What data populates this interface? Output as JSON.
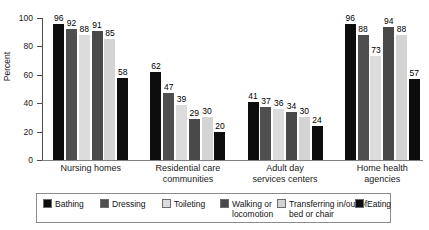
{
  "chart_data": {
    "type": "bar",
    "title": "",
    "xlabel": "",
    "ylabel": "Percent",
    "ylim": [
      0,
      100
    ],
    "yticks": [
      0,
      20,
      40,
      60,
      80,
      100
    ],
    "ytick_labels": [
      "0",
      "20",
      "40",
      "60",
      "80",
      "100"
    ],
    "grid": false,
    "legend_position": "bottom",
    "categories": [
      "Nursing  homes",
      "Residential care\ncommunities",
      "Adult day\nservices centers",
      "Home health\nagencies"
    ],
    "series": [
      {
        "name": "Bathing",
        "color": "#0d0d0d",
        "values": [
          96,
          62,
          41,
          96
        ]
      },
      {
        "name": "Dressing",
        "color": "#4f4f4f",
        "values": [
          92,
          47,
          37,
          88
        ]
      },
      {
        "name": "Toileting",
        "color": "#dcdcdc",
        "values": [
          88,
          39,
          36,
          73
        ]
      },
      {
        "name": "Walking or\nlocomotion",
        "color": "#494949",
        "values": [
          91,
          29,
          34,
          94
        ]
      },
      {
        "name": "Transferring in/out of\nbed or chair",
        "color": "#d4d4d4",
        "values": [
          85,
          30,
          30,
          88
        ]
      },
      {
        "name": "Eating",
        "color": "#0d0d0d",
        "values": [
          58,
          20,
          24,
          57
        ]
      }
    ],
    "data_labels": [
      [
        "96",
        "92",
        "88",
        "91",
        "85",
        "58"
      ],
      [
        "62",
        "47",
        "39",
        "29",
        "30",
        "20"
      ],
      [
        "41",
        "37",
        "36",
        "34",
        "30",
        "24"
      ],
      [
        "96",
        "88",
        "73",
        "94",
        "88",
        "57"
      ]
    ]
  },
  "legend": {
    "items": [
      {
        "label": "Bathing",
        "color": "#0d0d0d"
      },
      {
        "label": "Dressing",
        "color": "#4f4f4f"
      },
      {
        "label": "Toileting",
        "color": "#dcdcdc"
      },
      {
        "label": "Walking or\nlocomotion",
        "color": "#494949"
      },
      {
        "label": "Transferring in/out of\nbed or chair",
        "color": "#d4d4d4"
      },
      {
        "label": "Eating",
        "color": "#0d0d0d"
      }
    ]
  }
}
